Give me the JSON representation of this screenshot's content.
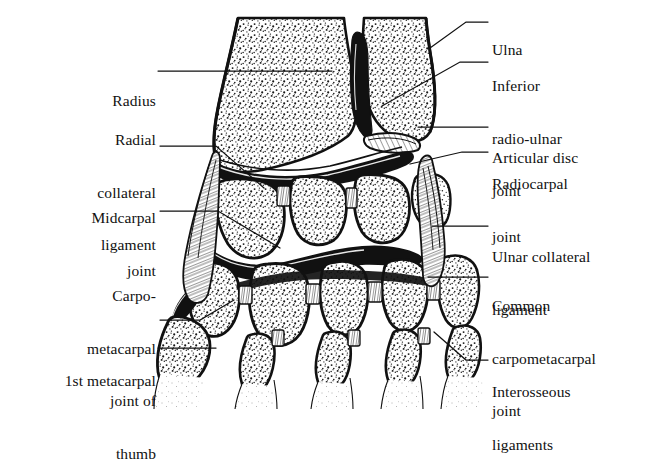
{
  "figure": {
    "background_color": "#ffffff",
    "ink_color": "#111111",
    "stipple_color": "#1a1a1a"
  },
  "labels_left": [
    {
      "name": "radius",
      "lines": [
        "Radius"
      ],
      "text": "Radius",
      "x": 72,
      "y": 58,
      "width": 84,
      "leader": "M158,72 L332,72"
    },
    {
      "name": "radial-collateral-ligament",
      "lines": [
        "Radial",
        "collateral",
        "ligament"
      ],
      "text": "Radial collateral ligament",
      "x": 48,
      "y": 96,
      "width": 108,
      "leader": "M160,146 L214,146 L262,186"
    },
    {
      "name": "midcarpal-joint",
      "lines": [
        "Midcarpal",
        "joint"
      ],
      "text": "Midcarpal joint",
      "x": 48,
      "y": 174,
      "width": 108,
      "leader": "M160,211 L216,211 L276,246"
    },
    {
      "name": "carpometacarpal-joint-of-thumb",
      "lines": [
        "Carpo-",
        "metacarpal",
        "joint of",
        "thumb"
      ],
      "text": "Carpo-metacarpal joint of thumb",
      "x": 38,
      "y": 252,
      "width": 118,
      "leader": "M160,320 L198,320 L232,302"
    },
    {
      "name": "first-metacarpal",
      "lines": [
        "1st metacarpal"
      ],
      "text": "1st metacarpal",
      "x": 22,
      "y": 336,
      "width": 134,
      "leader": "M160,348 L214,348"
    }
  ],
  "labels_right": [
    {
      "name": "ulna",
      "lines": [
        "Ulna"
      ],
      "text": "Ulna",
      "x": 492,
      "y": 6,
      "leader": "M432,46 L468,22 L488,22"
    },
    {
      "name": "inferior-radio-ulnar-joint",
      "lines": [
        "Inferior",
        "radio-ulnar",
        "joint"
      ],
      "text": "Inferior radio-ulnar joint",
      "x": 492,
      "y": 42,
      "leader": "M384,104 L462,62 L488,62"
    },
    {
      "name": "articular-disc",
      "lines": [
        "Articular disc"
      ],
      "text": "Articular disc",
      "x": 492,
      "y": 114,
      "leader": "M418,126 L488,126"
    },
    {
      "name": "radiocarpal-joint",
      "lines": [
        "Radiocarpal",
        "joint"
      ],
      "text": "Radiocarpal joint",
      "x": 492,
      "y": 140,
      "leader": "M412,162 L462,152 L488,152"
    },
    {
      "name": "ulnar-collateral-ligament",
      "lines": [
        "Ulnar collateral",
        "ligament"
      ],
      "text": "Ulnar collateral ligament",
      "x": 492,
      "y": 213,
      "leader": "M432,226 L488,226"
    },
    {
      "name": "common-carpometacarpal-joint",
      "lines": [
        "Common",
        "carpometacarpal",
        "joint"
      ],
      "text": "Common carpometacarpal joint",
      "x": 492,
      "y": 262,
      "leader": "M428,276 L488,276"
    },
    {
      "name": "interosseous-ligaments",
      "lines": [
        "Interosseous",
        "ligaments"
      ],
      "text": "Interosseous ligaments",
      "x": 492,
      "y": 348,
      "leader": "M436,334 L466,360 L488,360"
    }
  ],
  "anatomy_parts": [
    "radius",
    "ulna",
    "articular-disc",
    "radiocarpal-joint",
    "inferior-radio-ulnar-joint",
    "midcarpal-joint",
    "carpal-bones",
    "metacarpal-bases",
    "radial-collateral-ligament",
    "ulnar-collateral-ligament",
    "interosseous-ligaments"
  ]
}
